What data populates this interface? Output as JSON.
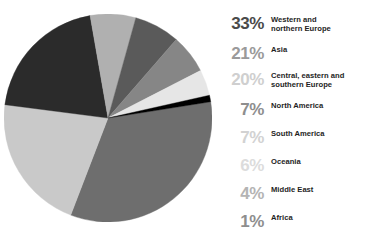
{
  "caption": "",
  "chart_data": {
    "type": "pie",
    "title": "",
    "xlabel": "",
    "ylabel": "",
    "unit": "%",
    "start_angle_deg": -9,
    "direction": "clockwise",
    "categories": [
      "Western and northern Europe",
      "Asia",
      "Central, eastern and southern Europe",
      "North America",
      "South America",
      "Oceania",
      "Middle East",
      "Africa"
    ],
    "values": [
      33,
      21,
      20,
      7,
      7,
      6,
      4,
      1
    ],
    "slices": [
      {
        "label": "Western and northern Europe",
        "value": 33,
        "color": "#6e6e6e"
      },
      {
        "label": "Asia",
        "value": 21,
        "color": "#c9c9c9"
      },
      {
        "label": "Central, eastern and southern Europe",
        "value": 20,
        "color": "#2b2b2b"
      },
      {
        "label": "North America",
        "value": 7,
        "color": "#b0b0b0"
      },
      {
        "label": "South America",
        "value": 7,
        "color": "#5a5a5a"
      },
      {
        "label": "Oceania",
        "value": 6,
        "color": "#868686"
      },
      {
        "label": "Middle East",
        "value": 4,
        "color": "#e6e6e6"
      },
      {
        "label": "Africa",
        "value": 1,
        "color": "#000000"
      }
    ],
    "legend_position": "right",
    "grid": false
  },
  "legend": {
    "rows": [
      {
        "pct": "33%",
        "label": "Western and\nnorthern Europe",
        "pct_color": "#4a4a4a"
      },
      {
        "pct": "21%",
        "label": "Asia",
        "pct_color": "#9a9a9a"
      },
      {
        "pct": "20%",
        "label": "Central, eastern and\nsouthern Europe",
        "pct_color": "#cfcfcf"
      },
      {
        "pct": "7%",
        "label": "North America",
        "pct_color": "#8e8e8e"
      },
      {
        "pct": "7%",
        "label": "South America",
        "pct_color": "#d2d2d2"
      },
      {
        "pct": "6%",
        "label": "Oceania",
        "pct_color": "#dcdcdc"
      },
      {
        "pct": "4%",
        "label": "Middle East",
        "pct_color": "#b4b4b4"
      },
      {
        "pct": "1%",
        "label": "Africa",
        "pct_color": "#8e8e8e"
      }
    ],
    "row_tops": [
      6,
      36,
      62,
      92,
      120,
      148,
      176,
      204
    ]
  }
}
